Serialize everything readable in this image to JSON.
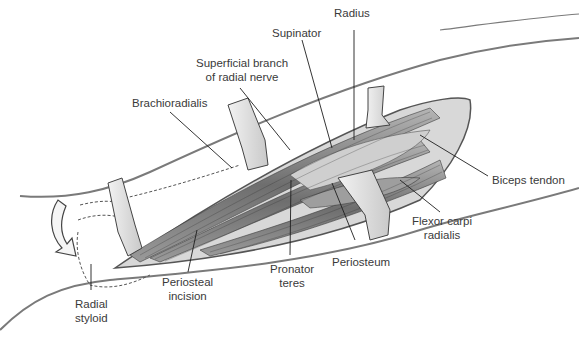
{
  "figure": {
    "colors": {
      "outline": "#6b6b6b",
      "muscle_dark": "#4a4a4a",
      "muscle_mid": "#8a8a8a",
      "retractor": "#e6e6e6",
      "label_text": "#3a3a3a"
    }
  },
  "labels": {
    "radius": "Radius",
    "supinator": "Supinator",
    "superficial_branch": {
      "line1": "Superficial branch",
      "line2": "of radial nerve"
    },
    "brachioradialis": "Brachioradialis",
    "biceps_tendon": "Biceps tendon",
    "flexor_carpi_radialis": {
      "line1": "Flexor carpi",
      "line2": "radialis"
    },
    "periosteum": "Periosteum",
    "pronator_teres": {
      "line1": "Pronator",
      "line2": "teres"
    },
    "periosteal_incision": {
      "line1": "Periosteal",
      "line2": "incision"
    },
    "radial_styloid": {
      "line1": "Radial",
      "line2": "styloid"
    }
  },
  "icons": {
    "rotation_arrow": "curved-arrow-icon"
  }
}
